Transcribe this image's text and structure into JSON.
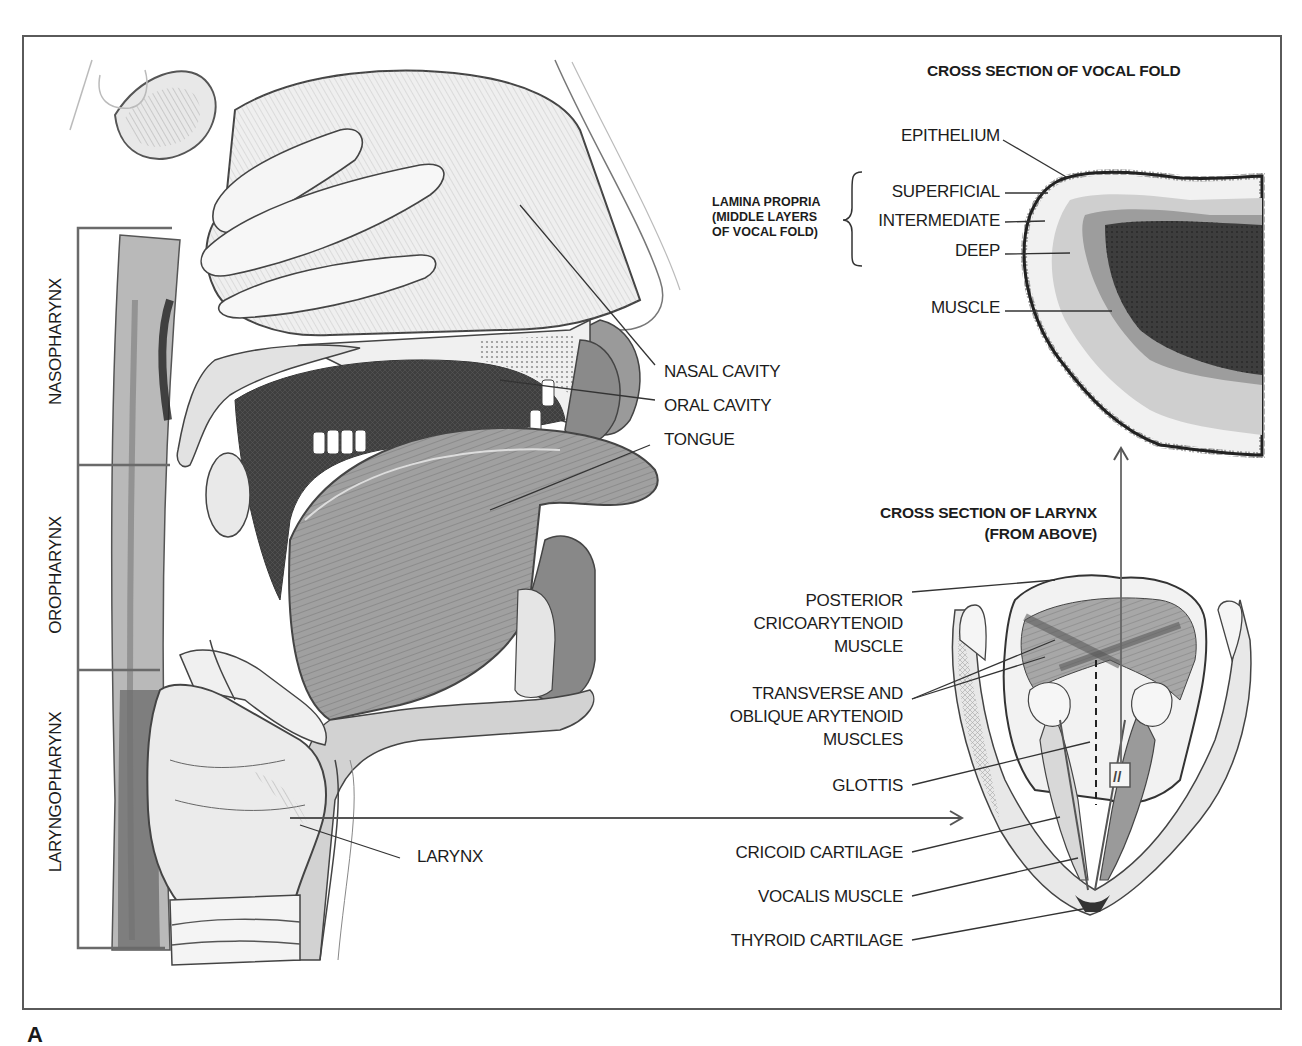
{
  "figure": {
    "figure_letter": "A",
    "sagittal_view": {
      "pharynx_regions": [
        "NASOPHARYNX",
        "OROPHARYNX",
        "LARYNGOPHARYNX"
      ],
      "labels": {
        "nasal_cavity": "NASAL CAVITY",
        "oral_cavity": "ORAL CAVITY",
        "tongue": "TONGUE",
        "larynx": "LARYNX"
      }
    },
    "vocal_fold_section": {
      "title": "CROSS SECTION OF VOCAL FOLD",
      "epithelium": "EPITHELIUM",
      "lamina_propria_group": {
        "line1": "LAMINA PROPRIA",
        "line2": "(MIDDLE LAYERS",
        "line3": "OF VOCAL FOLD)",
        "layers": [
          "SUPERFICIAL",
          "INTERMEDIATE",
          "DEEP"
        ]
      },
      "muscle": "MUSCLE"
    },
    "larynx_section": {
      "title_line1": "CROSS  SECTION OF LARYNX",
      "title_line2": "(FROM ABOVE)",
      "labels": {
        "posterior_ca_1": "POSTERIOR",
        "posterior_ca_2": "CRICOARYTENOID",
        "posterior_ca_3": "MUSCLE",
        "arytenoid_1": "TRANSVERSE AND",
        "arytenoid_2": "OBLIQUE ARYTENOID",
        "arytenoid_3": "MUSCLES",
        "glottis": "GLOTTIS",
        "cricoid": "CRICOID CARTILAGE",
        "vocalis": "VOCALIS MUSCLE",
        "thyroid": "THYROID CARTILAGE"
      },
      "section_marker": "//"
    },
    "colors": {
      "frame": "#5a5a5a",
      "ink": "#1c1c1c",
      "leader_line": "#444444",
      "tissue_dark": "#3a3a3a",
      "tissue_mid": "#8c8c8c",
      "tissue_light": "#d6d6d6"
    }
  }
}
